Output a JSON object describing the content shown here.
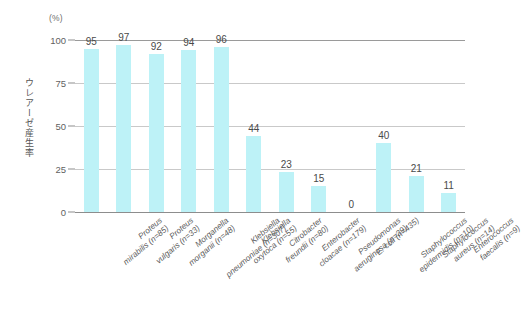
{
  "chart_data": {
    "type": "bar",
    "title": "",
    "subtitle": "",
    "xlabel": "",
    "ylabel": "ウレアーゼ産生率",
    "unit_label": "(%)",
    "ylim": [
      0,
      100
    ],
    "yticks": [
      0,
      25,
      50,
      75,
      100
    ],
    "ytick_labels": [
      "0",
      "25",
      "50",
      "75",
      "100"
    ],
    "grid": "horizontal",
    "legend": "none",
    "bar_color": "#bdf2f7",
    "categories": [
      "Proteus mirabilis (n=85)",
      "Proteus vulgaris (n=33)",
      "Morganella morganii (n=48)",
      "Klebsiella pneumoniae (n=307)",
      "Klebsiella oxytoca (n=55)",
      "Citrobacter freundii (n=80)",
      "Enterobacter cloacae (n=179)",
      "Pseudomonas aeruginosa (n=39)",
      "E. coli (n=435)",
      "Staphylococcus epidermidis (n=10)",
      "Staphylococcus aureus (n=14)",
      "Enterococcus faecalis (n=9)"
    ],
    "category_lines": [
      [
        "Proteus",
        "mirabilis (n=85)"
      ],
      [
        "Proteus",
        "vulgaris (n=33)"
      ],
      [
        "Morganella",
        "morganii (n=48)"
      ],
      [
        "Klebsiella",
        "pneumoniae (n=307)"
      ],
      [
        "Klebsiella",
        "oxytoca (n=55)"
      ],
      [
        "Citrobacter",
        "freundii (n=80)"
      ],
      [
        "Enterobacter",
        "cloacae (n=179)"
      ],
      [
        "Pseudomonas",
        "aeruginosa (n=39)"
      ],
      [
        "E. coli (n=435)",
        ""
      ],
      [
        "Staphylococcus",
        "epidermidis (n=10)"
      ],
      [
        "Staphylococcus",
        "aureus (n=14)"
      ],
      [
        "Enterococcus",
        "faecalis (n=9)"
      ]
    ],
    "values": [
      95,
      97,
      92,
      94,
      96,
      44,
      23,
      15,
      0,
      40,
      21,
      11
    ],
    "value_labels": [
      "95",
      "97",
      "92",
      "94",
      "96",
      "44",
      "23",
      "15",
      "0",
      "40",
      "21",
      "11"
    ]
  }
}
